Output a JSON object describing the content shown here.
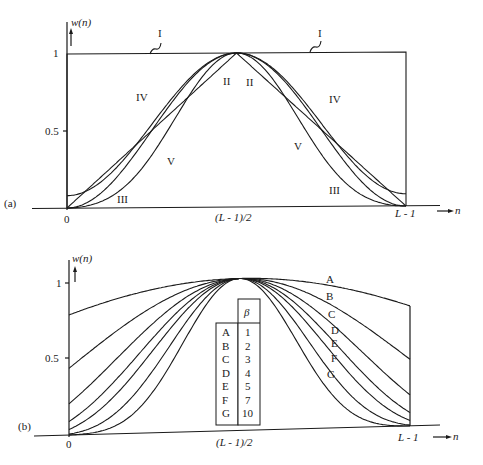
{
  "panel_a": {
    "label": "(a)",
    "y_axis_label": "w(n)",
    "y_ticks": [
      "1",
      "0.5"
    ],
    "x_ticks": [
      "0",
      "(L - 1)/2",
      "L - 1"
    ],
    "x_axis_label": "n",
    "curves": [
      {
        "id": "I",
        "label": "I",
        "name": "rectangular"
      },
      {
        "id": "II",
        "label": "II",
        "name": "triangular"
      },
      {
        "id": "III",
        "label": "III",
        "name": "hanning"
      },
      {
        "id": "IV",
        "label": "IV",
        "name": "hamming"
      },
      {
        "id": "V",
        "label": "V",
        "name": "blackman"
      }
    ]
  },
  "panel_b": {
    "label": "(b)",
    "y_axis_label": "w(n)",
    "y_ticks": [
      "1",
      "0.5"
    ],
    "x_ticks": [
      "0",
      "(L - 1)/2",
      "L - 1"
    ],
    "x_axis_label": "n",
    "table_header": "β",
    "table": [
      {
        "curve": "A",
        "beta": 1
      },
      {
        "curve": "B",
        "beta": 2
      },
      {
        "curve": "C",
        "beta": 3
      },
      {
        "curve": "D",
        "beta": 4
      },
      {
        "curve": "E",
        "beta": 5
      },
      {
        "curve": "F",
        "beta": 7
      },
      {
        "curve": "G",
        "beta": 10
      }
    ]
  }
}
